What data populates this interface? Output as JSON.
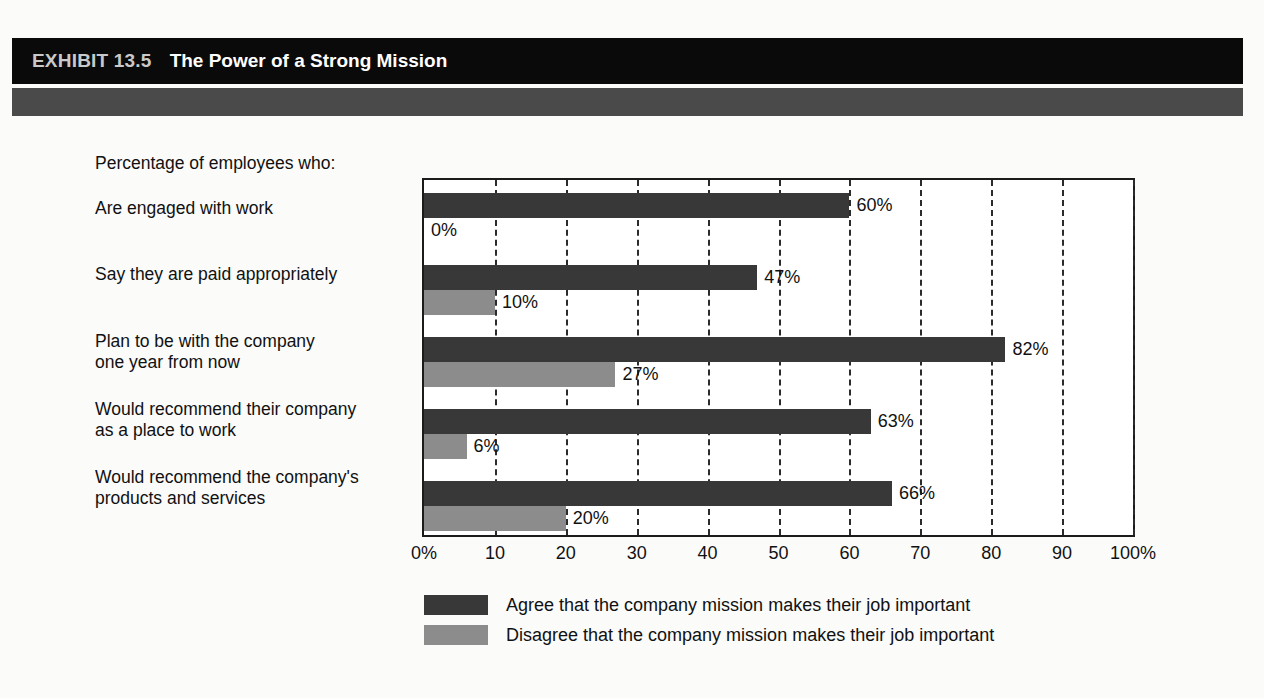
{
  "header": {
    "exhibit_number": "EXHIBIT 13.5",
    "title": "The Power of a Strong Mission"
  },
  "chart_data": {
    "type": "bar",
    "orientation": "horizontal",
    "title": "The Power of a Strong Mission",
    "caption": "Percentage of employees who:",
    "xlabel": "",
    "ylabel": "",
    "xlim": [
      0,
      100
    ],
    "grid": true,
    "grid_style": "dashed-vertical",
    "legend_position": "bottom",
    "categories": [
      "Are engaged with work",
      "Say they are paid appropriately",
      "Plan to be with the company\none year from now",
      "Would recommend their company\nas a place to work",
      "Would recommend the company's\nproducts and services"
    ],
    "series": [
      {
        "name": "Agree that the company mission makes their job important",
        "color": "#383838",
        "values": [
          60,
          47,
          82,
          63,
          66
        ],
        "labels": [
          "60%",
          "47%",
          "82%",
          "63%",
          "66%"
        ]
      },
      {
        "name": "Disagree that the company mission makes their job important",
        "color": "#8c8c8c",
        "values": [
          0,
          10,
          27,
          6,
          20
        ],
        "labels": [
          "0%",
          "10%",
          "27%",
          "6%",
          "20%"
        ]
      }
    ],
    "xticks": [
      0,
      10,
      20,
      30,
      40,
      50,
      60,
      70,
      80,
      90,
      100
    ],
    "xtick_labels": [
      "0%",
      "10",
      "20",
      "30",
      "40",
      "50",
      "60",
      "70",
      "80",
      "90",
      "100%"
    ]
  },
  "colors": {
    "band_black": "#0a0a0a",
    "band_gray": "#4a4a4a",
    "agree": "#383838",
    "disagree": "#8c8c8c",
    "text": "#111111"
  }
}
